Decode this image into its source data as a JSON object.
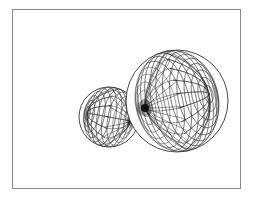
{
  "figure": {
    "frame": {
      "x": 12,
      "y": 9,
      "width": 229,
      "height": 180,
      "stroke": "#8a8a8a"
    },
    "line_color": "#333333",
    "pole_color": "#111111",
    "spheres": [
      {
        "name": "small-lobe",
        "cx": 109,
        "cy": 117,
        "r": 30,
        "pole_x": 131,
        "pole_y": 121,
        "rings": 14,
        "meridians": 16
      },
      {
        "name": "large-lobe",
        "cx": 177,
        "cy": 101,
        "r": 51,
        "pole_x": 145,
        "pole_y": 108,
        "rings": 18,
        "meridians": 22
      }
    ]
  }
}
